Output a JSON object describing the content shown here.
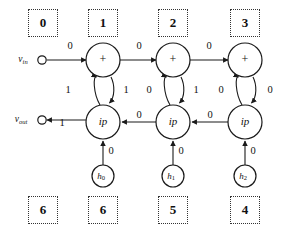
{
  "diagram": {
    "terminals": [
      {
        "id": "v-in",
        "label": "v",
        "sub": "in",
        "x": 42,
        "y": 60
      },
      {
        "id": "v-out",
        "label": "v",
        "sub": "out",
        "x": 42,
        "y": 120
      }
    ],
    "adder_nodes": [
      {
        "id": "adder-1",
        "label": "+",
        "cx": 103,
        "cy": 60,
        "r": 17
      },
      {
        "id": "adder-2",
        "label": "+",
        "cx": 173,
        "cy": 60,
        "r": 17
      },
      {
        "id": "adder-3",
        "label": "+",
        "cx": 245,
        "cy": 60,
        "r": 17
      }
    ],
    "ip_nodes": [
      {
        "id": "ip-1",
        "label": "ip",
        "cx": 103,
        "cy": 122,
        "r": 17
      },
      {
        "id": "ip-2",
        "label": "ip",
        "cx": 173,
        "cy": 122,
        "r": 17
      },
      {
        "id": "ip-3",
        "label": "ip",
        "cx": 245,
        "cy": 122,
        "r": 17
      }
    ],
    "h_nodes": [
      {
        "id": "h-0",
        "label": "h",
        "sub": "0",
        "cx": 103,
        "cy": 176,
        "r": 11
      },
      {
        "id": "h-1",
        "label": "h",
        "sub": "1",
        "cx": 173,
        "cy": 176,
        "r": 11
      },
      {
        "id": "h-2",
        "label": "h",
        "sub": "2",
        "cx": 245,
        "cy": 176,
        "r": 11
      }
    ],
    "edge_weights": {
      "vin_to_adder1": "0",
      "adder1_to_adder2": "0",
      "adder2_to_adder3": "0",
      "ip1_to_vout": "1",
      "ip2_to_ip1": "0",
      "ip3_to_ip2": "0",
      "ip1_to_adder1": "1",
      "adder1_to_ip1": "1",
      "ip2_to_adder2": "0",
      "adder2_to_ip2": "1",
      "ip3_to_adder3": "0",
      "adder3_to_ip3": "0",
      "h0_to_ip1": "0",
      "h1_to_ip2": "0",
      "h2_to_ip3": "0"
    },
    "top_boxes": [
      {
        "id": "top-box-0",
        "value": "0",
        "x": 28,
        "y": 9
      },
      {
        "id": "top-box-1",
        "value": "1",
        "x": 88,
        "y": 9
      },
      {
        "id": "top-box-2",
        "value": "2",
        "x": 158,
        "y": 9
      },
      {
        "id": "top-box-3",
        "value": "3",
        "x": 230,
        "y": 9
      }
    ],
    "bottom_boxes": [
      {
        "id": "bottom-box-0",
        "value": "6",
        "x": 28,
        "y": 196
      },
      {
        "id": "bottom-box-1",
        "value": "6",
        "x": 88,
        "y": 196
      },
      {
        "id": "bottom-box-2",
        "value": "5",
        "x": 158,
        "y": 196
      },
      {
        "id": "bottom-box-3",
        "value": "4",
        "x": 230,
        "y": 196
      }
    ]
  }
}
